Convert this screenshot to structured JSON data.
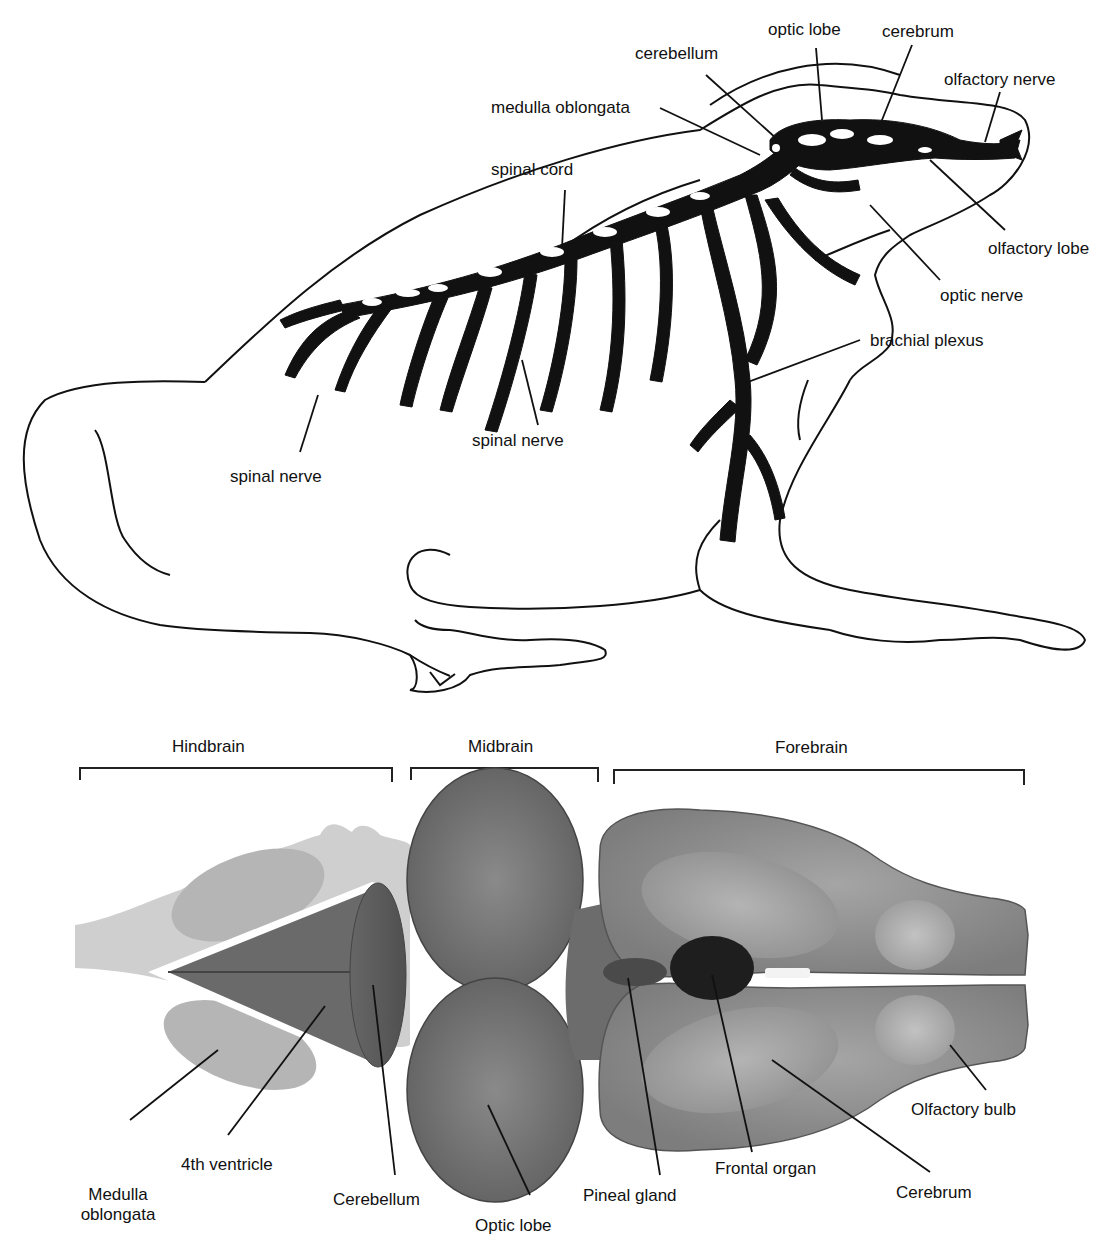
{
  "frog_diagram": {
    "labels": {
      "optic_lobe": "optic lobe",
      "cerebrum": "cerebrum",
      "cerebellum": "cerebellum",
      "olfactory_nerve": "olfactory nerve",
      "medulla_oblongata": "medulla oblongata",
      "spinal_cord": "spinal cord",
      "olfactory_lobe": "olfactory lobe",
      "optic_nerve": "optic nerve",
      "brachial_plexus": "brachial plexus",
      "spinal_nerve_mid": "spinal nerve",
      "spinal_nerve_left": "spinal nerve"
    }
  },
  "brain_diagram": {
    "regions": {
      "hindbrain": "Hindbrain",
      "midbrain": "Midbrain",
      "forebrain": "Forebrain"
    },
    "labels": {
      "medulla_line1": "Medulla",
      "medulla_line2": "oblongata",
      "fourth_ventricle": "4th ventricle",
      "cerebellum": "Cerebellum",
      "optic_lobe": "Optic lobe",
      "pineal_gland": "Pineal gland",
      "frontal_organ": "Frontal organ",
      "cerebrum": "Cerebrum",
      "olfactory_bulb": "Olfactory bulb"
    }
  }
}
